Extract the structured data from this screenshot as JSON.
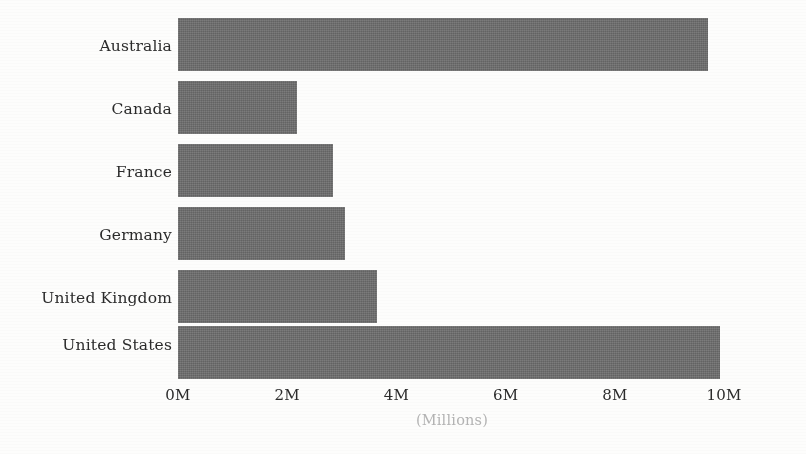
{
  "chart_data": {
    "type": "bar",
    "orientation": "horizontal",
    "title": "",
    "subtitle": "",
    "xlabel": "(Millions)",
    "ylabel": "",
    "categories": [
      "Australia",
      "Canada",
      "France",
      "Germany",
      "United Kingdom",
      "United States"
    ],
    "values": [
      9.7,
      2.18,
      2.84,
      3.06,
      3.64,
      9.93
    ],
    "value_unit": "Millions",
    "xlim": [
      0,
      10
    ],
    "xticks": [
      0,
      2,
      4,
      6,
      8,
      10
    ],
    "xtick_labels": [
      "0M",
      "2M",
      "4M",
      "6M",
      "8M",
      "10M"
    ],
    "grid": false,
    "legend": null,
    "legend_position": "none",
    "series": [
      {
        "name": "",
        "values": [
          9.7,
          2.18,
          2.84,
          3.06,
          3.64,
          9.93
        ]
      }
    ],
    "colors": {
      "bar_fill": "#6d6d6d",
      "text": "#2b2b2b",
      "axis_title": "#b4b4b4",
      "background": "#fdfdfc"
    }
  },
  "axis": {
    "x_title": "(Millions)",
    "ticks": [
      {
        "label": "0M",
        "value": 0
      },
      {
        "label": "2M",
        "value": 2
      },
      {
        "label": "4M",
        "value": 4
      },
      {
        "label": "6M",
        "value": 6
      },
      {
        "label": "8M",
        "value": 8
      },
      {
        "label": "10M",
        "value": 10
      }
    ]
  },
  "bars": [
    {
      "label": "Australia",
      "value": 9.7
    },
    {
      "label": "Canada",
      "value": 2.18
    },
    {
      "label": "France",
      "value": 2.84
    },
    {
      "label": "Germany",
      "value": 3.06
    },
    {
      "label": "United Kingdom",
      "value": 3.64
    },
    {
      "label": "United States",
      "value": 9.93
    }
  ]
}
